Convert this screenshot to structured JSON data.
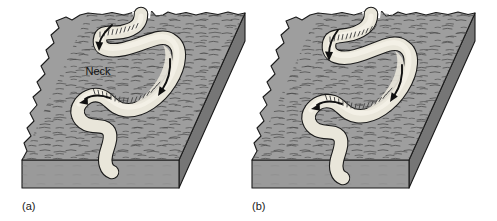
{
  "figure": {
    "background_color": "#ffffff"
  },
  "colors": {
    "top_surface": "#9a9a9a",
    "top_surface_light": "#a6a6a6",
    "side_face": "#8a8a8a",
    "front_face": "#969696",
    "right_face": "#777777",
    "river_fill": "#e9e6da",
    "river_highlight": "#f2efe6",
    "outline": "#1a1a1a",
    "texture_stroke": "#4a4a4a",
    "arrow_fill": "#101010",
    "bank_stipple": "#555555",
    "label_text": "#1a1a1a"
  },
  "panels": [
    {
      "id": "a",
      "label": "(a)",
      "label_x": 22,
      "label_y": 210,
      "annotations": [
        {
          "name": "neck",
          "text": "Neck",
          "x": 98,
          "y": 75
        }
      ],
      "flow_arrows": [
        {
          "name": "upper-loop-arrow",
          "direction": "southwest"
        },
        {
          "name": "middle-loop-arrow",
          "direction": "west"
        },
        {
          "name": "right-channel-arrow",
          "direction": "southeast"
        },
        {
          "name": "inner-bend-arrow",
          "direction": "south"
        }
      ],
      "features": [
        "meander-loop-upper",
        "meander-loop-lower",
        "neck",
        "point-bar-stipple",
        "floodplain-surface"
      ]
    },
    {
      "id": "b",
      "label": "(b)",
      "label_x": 252,
      "label_y": 210,
      "annotations": [],
      "flow_arrows": [
        {
          "name": "upper-loop-arrow",
          "direction": "south"
        },
        {
          "name": "middle-loop-arrow",
          "direction": "west"
        },
        {
          "name": "right-channel-arrow",
          "direction": "southeast"
        },
        {
          "name": "inner-bend-arrow",
          "direction": "south"
        }
      ],
      "features": [
        "meander-loop-upper",
        "meander-loop-lower",
        "narrowed-neck",
        "point-bar-stipple",
        "floodplain-surface"
      ]
    }
  ]
}
